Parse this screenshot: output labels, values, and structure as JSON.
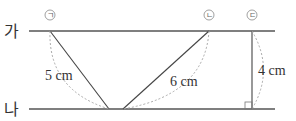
{
  "diagram": {
    "type": "parallel-lines-distance",
    "lines": [
      {
        "id": "ga",
        "label": "가",
        "y": 31
      },
      {
        "id": "na",
        "label": "나",
        "y": 109
      }
    ],
    "segments": [
      {
        "id": "giyeok",
        "marker": "ㄱ",
        "measure": "5 cm"
      },
      {
        "id": "nieun",
        "marker": "ㄴ",
        "measure": "6 cm"
      },
      {
        "id": "digeut",
        "marker": "ㄷ",
        "measure": "4 cm",
        "perpendicular": true
      }
    ]
  }
}
